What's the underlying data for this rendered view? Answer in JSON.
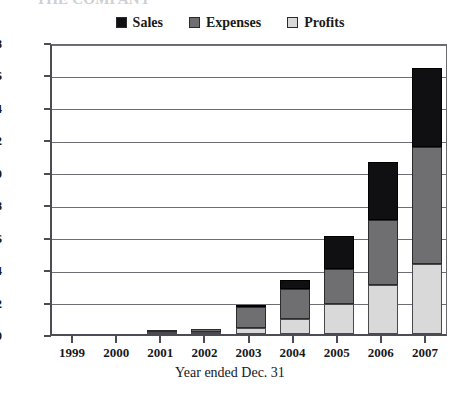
{
  "chart_data": {
    "type": "bar",
    "subtype": "stacked-bar",
    "title": "THE COMPANY",
    "xlabel": "Year ended Dec. 31",
    "ylabel": "",
    "categories": [
      "1999",
      "2000",
      "2001",
      "2002",
      "2003",
      "2004",
      "2005",
      "2006",
      "2007"
    ],
    "series": [
      {
        "name": "Profits",
        "color": "#d9d9d9",
        "values": [
          0.0,
          0.02,
          0.05,
          0.12,
          0.35,
          0.9,
          1.85,
          3.0,
          4.3
        ]
      },
      {
        "name": "Expenses",
        "color": "#6f6f72",
        "values": [
          0.02,
          0.03,
          0.08,
          0.2,
          1.3,
          1.9,
          2.15,
          4.0,
          7.2
        ]
      },
      {
        "name": "Sales",
        "color": "#100f11",
        "values": [
          0.0,
          0.0,
          0.02,
          0.03,
          0.05,
          0.5,
          2.05,
          3.6,
          4.9
        ]
      }
    ],
    "stack_order_bottom_to_top": [
      "Profits",
      "Expenses",
      "Sales"
    ],
    "totals": [
      0.02,
      0.05,
      0.15,
      0.35,
      1.7,
      3.3,
      6.05,
      10.6,
      16.4
    ],
    "ylim": [
      0,
      18
    ],
    "ytick_values": [
      0,
      2,
      4,
      6,
      8,
      10,
      12,
      14,
      16,
      18
    ],
    "ytick_labels": [
      "$0",
      "$2",
      "$4",
      "$6",
      "$8",
      "$10",
      "$12",
      "$14",
      "$16",
      "$18"
    ],
    "grid": true,
    "grid_axis": "y",
    "legend_position": "top-center",
    "legend_entries": [
      {
        "label": "Sales",
        "swatch": "#100f11"
      },
      {
        "label": "Expenses",
        "swatch": "#6f6f72"
      },
      {
        "label": "Profits",
        "swatch": "#d9d9d9"
      }
    ]
  }
}
